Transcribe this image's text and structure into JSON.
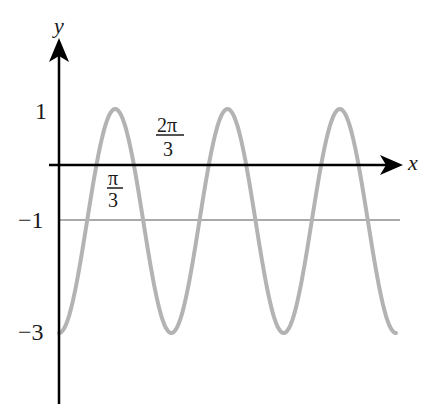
{
  "chart_data": {
    "type": "line",
    "title": "",
    "xlabel": "x",
    "ylabel": "y",
    "function": "y = -1 - 2cos(3x)",
    "series": [
      {
        "name": "curve",
        "color": "#b3b3b3",
        "x": [
          0,
          0.5236,
          1.0472,
          1.5708,
          2.0944,
          2.618,
          3.1416,
          3.6652,
          4.1888,
          4.7124,
          5.236,
          5.7596,
          6.2832
        ],
        "values": [
          -3,
          -1,
          1,
          -1,
          -3,
          -1,
          1,
          -1,
          -3,
          -1,
          1,
          -1,
          -3
        ]
      },
      {
        "name": "midline",
        "color": "#aaaaaa",
        "x": [
          0,
          6.2832
        ],
        "values": [
          -1,
          -1
        ]
      }
    ],
    "y_tick_labels": [
      "1",
      "−1",
      "−3"
    ],
    "y_ticks": [
      1,
      -1,
      -3
    ],
    "x_annotations": [
      {
        "label": "π/3",
        "value": 1.0472
      },
      {
        "label": "2π/3",
        "value": 2.0944
      }
    ],
    "grid": false,
    "legend": "none"
  },
  "labels": {
    "y_axis": "y",
    "x_axis": "x",
    "tick_1": "1",
    "tick_m1": "−1",
    "tick_m3": "−3",
    "pi3_num": "π",
    "pi3_den": "3",
    "twopi3_num": "2π",
    "twopi3_den": "3"
  }
}
